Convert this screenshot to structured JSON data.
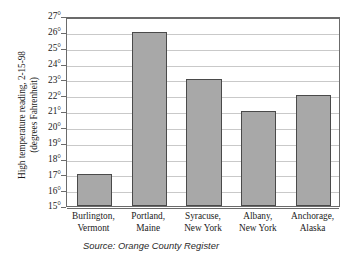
{
  "chart_data": {
    "type": "bar",
    "title": "",
    "subtitle": "",
    "categories": [
      "Burlington, Vermont",
      "Portland, Maine",
      "Syracuse, New York",
      "Albany, New York",
      "Anchorage, Alaska"
    ],
    "category_lines": [
      [
        "Burlington,",
        "Vermont"
      ],
      [
        "Portland,",
        "Maine"
      ],
      [
        "Syracuse,",
        "New York"
      ],
      [
        "Albany,",
        "New York"
      ],
      [
        "Anchorage,",
        "Alaska"
      ]
    ],
    "values": [
      17,
      26,
      23,
      21,
      22
    ],
    "xlabel": "",
    "ylabel": "High temperature reading, 2-15-98 (degrees Fahrenheit)",
    "ylabel_lines": [
      "High temperature reading, 2-15-98",
      "(degrees Fahrenheit)"
    ],
    "ylim": [
      15,
      27
    ],
    "ytick_step": 1,
    "ytick_labels": [
      "27°",
      "26°",
      "25°",
      "24°",
      "23°",
      "22°",
      "21°",
      "20°",
      "19°",
      "18°",
      "17°",
      "16°",
      "15°"
    ],
    "ytick_values": [
      27,
      26,
      25,
      24,
      23,
      22,
      21,
      20,
      19,
      18,
      17,
      16,
      15
    ],
    "grid": true,
    "grid_axis": "y",
    "legend": false,
    "legend_position": "none",
    "bar_color": "#a8a8a8",
    "bar_border_color": "#4a4a4a",
    "gridline_color": "#c9c9c9",
    "frame_color": "#6b6b6b",
    "background_color": "#ffffff",
    "source": "Source: Orange County Register"
  }
}
